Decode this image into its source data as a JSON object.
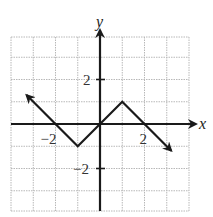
{
  "chart_data": {
    "type": "line",
    "title": "",
    "xlabel": "x",
    "ylabel": "y",
    "xlim": [
      -4,
      4
    ],
    "ylim": [
      -4,
      4
    ],
    "grid": true,
    "grid_step": 1,
    "x_tick_labels": [
      {
        "value": -2,
        "label": "-2"
      },
      {
        "value": 2,
        "label": "2"
      }
    ],
    "y_tick_labels": [
      {
        "value": 2,
        "label": "2"
      },
      {
        "value": -2,
        "label": "-2"
      }
    ],
    "series": [
      {
        "name": "f(x)",
        "points": [
          [
            -3.3,
            1.3
          ],
          [
            -2,
            0
          ],
          [
            -1,
            -1
          ],
          [
            0,
            0
          ],
          [
            1,
            1
          ],
          [
            2,
            0
          ],
          [
            3.2,
            -1.2
          ]
        ],
        "arrow_start": true,
        "arrow_end": true
      }
    ],
    "colors": {
      "grid": "#b8b8b8",
      "axis": "#1a1a1a",
      "curve": "#1a1a1a"
    }
  }
}
